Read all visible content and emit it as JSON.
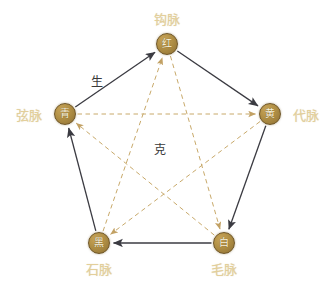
{
  "diagram": {
    "colors": {
      "node_fill": "#b08f45",
      "node_text": "#fdf6df",
      "node_label": "#e3cf9a",
      "sheng_line": "#3b3b42",
      "ke_line": "#c8a96a",
      "relation_text": "#3a3a3a",
      "background": "#ffffff"
    },
    "nodes": [
      {
        "id": "red",
        "char": "红",
        "label": "钩脉",
        "cx": 167,
        "cy": 44,
        "label_x": 167,
        "label_y": 18,
        "label_anchor": "center"
      },
      {
        "id": "green",
        "char": "青",
        "label": "弦脉",
        "cx": 65,
        "cy": 114,
        "label_x": 42,
        "label_y": 114,
        "label_anchor": "right"
      },
      {
        "id": "yellow",
        "char": "黄",
        "label": "代脉",
        "cx": 270,
        "cy": 114,
        "label_x": 293,
        "label_y": 114,
        "label_anchor": "left"
      },
      {
        "id": "black",
        "char": "黑",
        "label": "石脉",
        "cx": 99,
        "cy": 243,
        "label_x": 99,
        "label_y": 268,
        "label_anchor": "center"
      },
      {
        "id": "white",
        "char": "白",
        "label": "毛脉",
        "cx": 224,
        "cy": 243,
        "label_x": 224,
        "label_y": 268,
        "label_anchor": "center"
      }
    ],
    "relations": [
      {
        "id": "sheng",
        "name": "生",
        "style": "solid",
        "label_x": 97,
        "label_y": 79
      },
      {
        "id": "ke",
        "name": "克",
        "style": "dashed",
        "label_x": 160,
        "label_y": 147
      }
    ],
    "sheng_edges": [
      {
        "from": "green",
        "to": "red"
      },
      {
        "from": "red",
        "to": "yellow"
      },
      {
        "from": "yellow",
        "to": "white"
      },
      {
        "from": "white",
        "to": "black"
      },
      {
        "from": "black",
        "to": "green"
      }
    ],
    "ke_edges": [
      {
        "from": "green",
        "to": "yellow"
      },
      {
        "from": "yellow",
        "to": "black"
      },
      {
        "from": "black",
        "to": "red"
      },
      {
        "from": "red",
        "to": "white"
      },
      {
        "from": "white",
        "to": "green"
      }
    ]
  }
}
